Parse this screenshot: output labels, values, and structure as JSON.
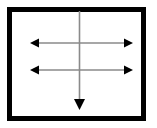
{
  "figure": {
    "name": "arrow-diagram",
    "width": 157,
    "height": 128,
    "background_color": "#ffffff"
  },
  "frame": {
    "name": "rectangle-border",
    "x": 7,
    "y": 7,
    "width": 139,
    "height": 114,
    "stroke_color": "#000000",
    "stroke_width": 5,
    "fill_color": "#ffffff"
  },
  "colors": {
    "line": "#8a8a8a",
    "arrowhead": "#000000",
    "border": "#000000",
    "background": "#ffffff"
  },
  "arrows": [
    {
      "id": "vertical-down-arrow",
      "label": "vertical down arrow",
      "orientation": "vertical",
      "heads": "single-end",
      "x1": 79.5,
      "y1": 11,
      "x2": 79.5,
      "y2": 110,
      "line_width": 1.6,
      "head_width": 11,
      "head_length": 11
    },
    {
      "id": "upper-horizontal-arrow",
      "label": "upper horizontal double arrow",
      "orientation": "horizontal",
      "heads": "both-ends",
      "x1": 30,
      "y1": 43,
      "x2": 133,
      "y2": 43,
      "line_width": 1.6,
      "head_width": 9,
      "head_length": 9
    },
    {
      "id": "lower-horizontal-arrow",
      "label": "lower horizontal double arrow",
      "orientation": "horizontal",
      "heads": "both-ends",
      "x1": 30,
      "y1": 70,
      "x2": 133,
      "y2": 70,
      "line_width": 1.6,
      "head_width": 9,
      "head_length": 9
    }
  ]
}
